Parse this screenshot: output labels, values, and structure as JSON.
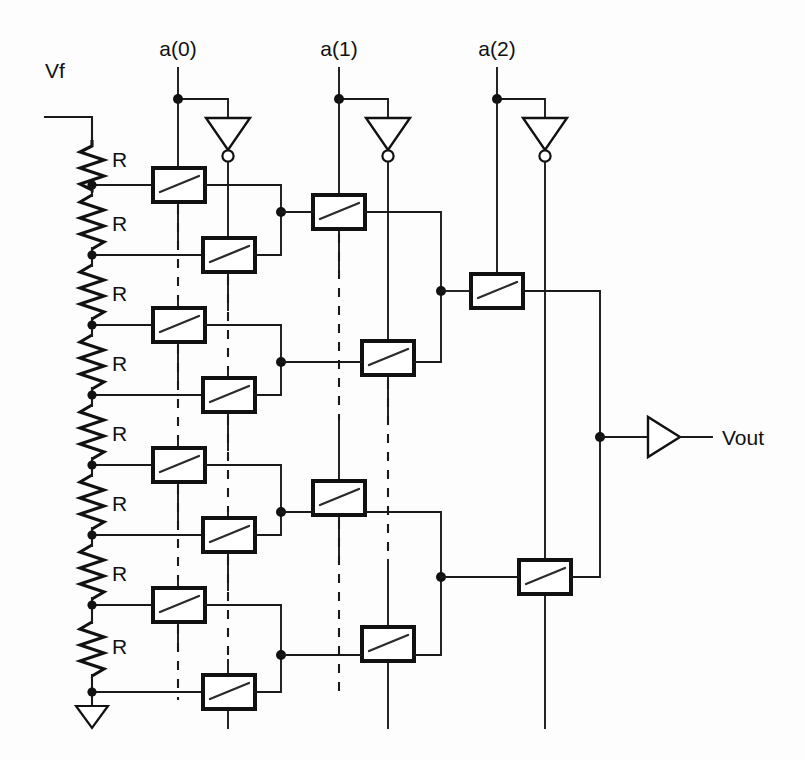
{
  "figure": {
    "kind": "schematic",
    "background_color": "#fdfdfd",
    "line_color": "#111111"
  },
  "labels": {
    "vf": "Vf",
    "vout": "Vout",
    "a0": "a(0)",
    "a1": "a(1)",
    "a2": "a(2)",
    "resistor": "R"
  },
  "resistor_string": {
    "count": 8,
    "label": "R",
    "top_label": "Vf",
    "bottom_symbol": "ground",
    "x": 92,
    "top_y": 130,
    "tap_ys": [
      185,
      255,
      325,
      395,
      465,
      535,
      605,
      692
    ],
    "labels": [
      "R",
      "R",
      "R",
      "R",
      "R",
      "R",
      "R",
      "R"
    ]
  },
  "columns": [
    {
      "name": "stage-0",
      "control_label": "a(0)",
      "control_x": 178,
      "inverter_x": 228,
      "label_x": 178,
      "label_y": 52,
      "node_y": 99,
      "switch_count": 8
    },
    {
      "name": "stage-1",
      "control_label": "a(1)",
      "control_x": 339,
      "inverter_x": 388,
      "label_x": 339,
      "label_y": 52,
      "node_y": 99,
      "switch_count": 4
    },
    {
      "name": "stage-2",
      "control_label": "a(2)",
      "control_x": 497,
      "inverter_x": 545,
      "label_x": 497,
      "label_y": 52,
      "node_y": 99,
      "switch_count": 2
    }
  ],
  "output": {
    "label": "Vout",
    "buffer_x": 648,
    "buffer_y": 437,
    "node_x": 600,
    "label_x": 700,
    "label_y": 444
  },
  "switches": {
    "type": "analog-transmission-gate",
    "stage0_true_x": 178,
    "stage0_comp_x": 228,
    "stage1_true_x": 339,
    "stage1_comp_x": 388,
    "stage2_true_x": 497,
    "stage2_comp_x": 545,
    "box_w": 52,
    "box_h": 34
  },
  "nodes": {
    "stage0_merge_x": 281,
    "stage1_merge_x": 441,
    "stage2_merge_x": 600,
    "stage0_merge_ys": [
      212,
      362,
      512,
      655
    ],
    "stage1_merge_ys": [
      291,
      577
    ],
    "stage2_merge_y": 437
  }
}
